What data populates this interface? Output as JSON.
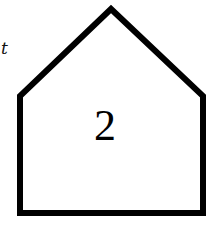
{
  "diagram": {
    "side_label": "t",
    "center_label": "2",
    "shape": "pentagon-house",
    "stroke_color": "#000000"
  }
}
